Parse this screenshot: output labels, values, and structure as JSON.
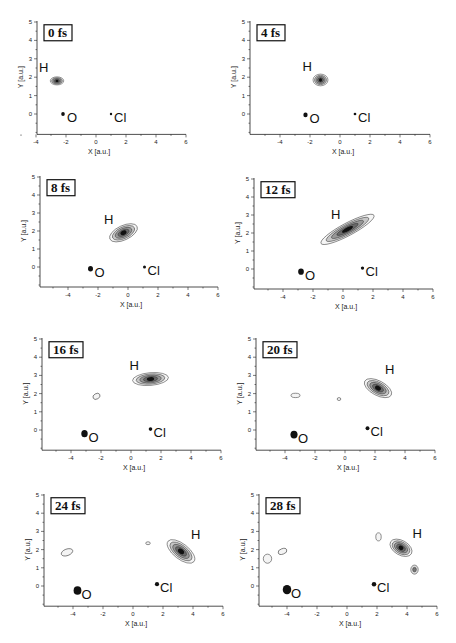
{
  "figure": {
    "axis": {
      "xlabel": "X [a.u.]",
      "ylabel": "Y [a.u.]",
      "xticks": [
        -4,
        -2,
        0,
        2,
        4,
        6
      ],
      "yticks": [
        0,
        1,
        2,
        3,
        4,
        5
      ]
    },
    "atoms": {
      "H": "H",
      "O": "O",
      "Cl": "Cl"
    }
  },
  "chart_data": [
    {
      "type": "heatmap",
      "title": "0 fs",
      "xlabel": "X [a.u.]",
      "ylabel": "Y [a.u.]",
      "xlim": [
        -5.7,
        6
      ],
      "ylim": [
        -1,
        5
      ],
      "atoms": {
        "H": [
          -2.6,
          1.8
        ],
        "O": [
          -2.2,
          0.0
        ],
        "Cl": [
          1.0,
          0.0
        ]
      },
      "blobs": [
        {
          "x": -2.6,
          "y": 1.8,
          "rx": 0.45,
          "ry": 0.22,
          "angle": 0,
          "intensity": 1.0
        }
      ]
    },
    {
      "type": "heatmap",
      "title": "4 fs",
      "xlabel": "X [a.u.]",
      "ylabel": "Y [a.u.]",
      "xlim": [
        -5.7,
        6
      ],
      "ylim": [
        -1,
        5
      ],
      "atoms": {
        "H": [
          -1.3,
          1.85
        ],
        "O": [
          -2.3,
          -0.05
        ],
        "Cl": [
          1.0,
          0.0
        ]
      },
      "blobs": [
        {
          "x": -1.3,
          "y": 1.85,
          "rx": 0.5,
          "ry": 0.32,
          "angle": 0,
          "intensity": 1.0
        }
      ]
    },
    {
      "type": "heatmap",
      "title": "8 fs",
      "xlabel": "X [a.u.]",
      "ylabel": "Y [a.u.]",
      "xlim": [
        -5.7,
        6
      ],
      "ylim": [
        -1,
        5
      ],
      "atoms": {
        "H": [
          -0.4,
          1.9
        ],
        "O": [
          -2.5,
          -0.1
        ],
        "Cl": [
          1.1,
          0.0
        ]
      },
      "blobs": [
        {
          "x": -0.3,
          "y": 1.9,
          "rx": 1.0,
          "ry": 0.4,
          "angle": -25,
          "intensity": 1.0
        }
      ]
    },
    {
      "type": "heatmap",
      "title": "12 fs",
      "xlabel": "X [a.u.]",
      "ylabel": "Y [a.u.]",
      "xlim": [
        -5.7,
        6
      ],
      "ylim": [
        -1,
        5
      ],
      "atoms": {
        "H": [
          0.4,
          2.3
        ],
        "O": [
          -2.8,
          -0.15
        ],
        "Cl": [
          1.3,
          0.05
        ]
      },
      "blobs": [
        {
          "x": 0.3,
          "y": 2.2,
          "rx": 2.0,
          "ry": 0.35,
          "angle": -28,
          "intensity": 1.0
        }
      ]
    },
    {
      "type": "heatmap",
      "title": "16 fs",
      "xlabel": "X [a.u.]",
      "ylabel": "Y [a.u.]",
      "xlim": [
        -5.7,
        6
      ],
      "ylim": [
        -1,
        5
      ],
      "atoms": {
        "H": [
          1.1,
          2.8
        ],
        "O": [
          -3.1,
          -0.2
        ],
        "Cl": [
          1.3,
          0.05
        ]
      },
      "blobs": [
        {
          "x": 1.3,
          "y": 2.8,
          "rx": 1.2,
          "ry": 0.35,
          "angle": -5,
          "intensity": 1.0
        },
        {
          "x": -2.3,
          "y": 1.85,
          "rx": 0.25,
          "ry": 0.15,
          "angle": -30,
          "intensity": 0.1
        }
      ]
    },
    {
      "type": "heatmap",
      "title": "20 fs",
      "xlabel": "X [a.u.]",
      "ylabel": "Y [a.u.]",
      "xlim": [
        -5.7,
        6
      ],
      "ylim": [
        -1,
        5
      ],
      "atoms": {
        "H": [
          2.0,
          2.4
        ],
        "O": [
          -3.4,
          -0.25
        ],
        "Cl": [
          1.5,
          0.1
        ]
      },
      "blobs": [
        {
          "x": 2.2,
          "y": 2.3,
          "rx": 1.0,
          "ry": 0.4,
          "angle": 28,
          "intensity": 1.0
        },
        {
          "x": -3.3,
          "y": 1.9,
          "rx": 0.3,
          "ry": 0.12,
          "angle": 0,
          "intensity": 0.1
        },
        {
          "x": -0.4,
          "y": 1.7,
          "rx": 0.12,
          "ry": 0.08,
          "angle": 0,
          "intensity": 0.1
        }
      ]
    },
    {
      "type": "heatmap",
      "title": "24 fs",
      "xlabel": "X [a.u.]",
      "ylabel": "Y [a.u.]",
      "xlim": [
        -5.7,
        6
      ],
      "ylim": [
        -1,
        5
      ],
      "atoms": {
        "H": [
          3.2,
          1.9
        ],
        "O": [
          -3.7,
          -0.25
        ],
        "Cl": [
          1.6,
          0.1
        ]
      },
      "blobs": [
        {
          "x": 3.2,
          "y": 1.9,
          "rx": 1.1,
          "ry": 0.42,
          "angle": 38,
          "intensity": 1.0
        },
        {
          "x": -4.4,
          "y": 1.85,
          "rx": 0.4,
          "ry": 0.18,
          "angle": -20,
          "intensity": 0.1
        },
        {
          "x": 1.0,
          "y": 2.35,
          "rx": 0.15,
          "ry": 0.08,
          "angle": 0,
          "intensity": 0.1
        }
      ]
    },
    {
      "type": "heatmap",
      "title": "28 fs",
      "xlabel": "X [a.u.]",
      "ylabel": "Y [a.u.]",
      "xlim": [
        -5.7,
        6
      ],
      "ylim": [
        -1,
        5
      ],
      "atoms": {
        "H": [
          3.7,
          2.0
        ],
        "O": [
          -4.0,
          -0.2
        ],
        "Cl": [
          1.8,
          0.1
        ]
      },
      "blobs": [
        {
          "x": 3.6,
          "y": 2.1,
          "rx": 0.8,
          "ry": 0.4,
          "angle": 30,
          "intensity": 1.0
        },
        {
          "x": 4.5,
          "y": 0.9,
          "rx": 0.25,
          "ry": 0.25,
          "angle": 0,
          "intensity": 0.5
        },
        {
          "x": 2.1,
          "y": 2.7,
          "rx": 0.18,
          "ry": 0.22,
          "angle": 0,
          "intensity": 0.1
        },
        {
          "x": -4.3,
          "y": 1.9,
          "rx": 0.3,
          "ry": 0.15,
          "angle": -20,
          "intensity": 0.1
        },
        {
          "x": -5.3,
          "y": 1.5,
          "rx": 0.28,
          "ry": 0.25,
          "angle": 0,
          "intensity": 0.1
        }
      ]
    }
  ]
}
